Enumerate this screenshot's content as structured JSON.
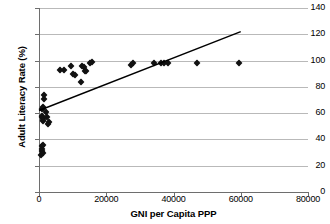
{
  "chart_data": {
    "type": "scatter",
    "title": "",
    "xlabel": "GNI per Capita PPP",
    "ylabel": "Adult Literacy Rate (%)",
    "xlim": [
      0,
      80000
    ],
    "ylim": [
      0,
      140
    ],
    "xticks": [
      0,
      20000,
      40000,
      60000,
      80000
    ],
    "yticks": [
      0,
      20,
      40,
      60,
      80,
      100,
      120,
      140
    ],
    "xtick_labels": [
      "0",
      "20000",
      "40000",
      "60000",
      "80000"
    ],
    "ytick_labels": [
      "0",
      "20",
      "40",
      "60",
      "80",
      "100",
      "120",
      "140"
    ],
    "grid": "horizontal",
    "legend": "none",
    "marker": "diamond",
    "marker_color": "#111111",
    "series": [
      {
        "name": "Countries",
        "points": [
          [
            700,
            28
          ],
          [
            800,
            31
          ],
          [
            900,
            33
          ],
          [
            1000,
            35
          ],
          [
            1100,
            36
          ],
          [
            1200,
            30
          ],
          [
            900,
            57
          ],
          [
            1000,
            58
          ],
          [
            1100,
            56
          ],
          [
            1200,
            55
          ],
          [
            1300,
            54
          ],
          [
            1000,
            63
          ],
          [
            1100,
            64
          ],
          [
            1200,
            65
          ],
          [
            1500,
            74
          ],
          [
            1600,
            71
          ],
          [
            2200,
            61
          ],
          [
            2600,
            52
          ],
          [
            3000,
            53
          ],
          [
            2400,
            57
          ],
          [
            6300,
            93
          ],
          [
            7300,
            93
          ],
          [
            9500,
            96
          ],
          [
            10200,
            90
          ],
          [
            10800,
            89
          ],
          [
            12600,
            84
          ],
          [
            12900,
            96
          ],
          [
            13400,
            95
          ],
          [
            13600,
            92
          ],
          [
            14000,
            92
          ],
          [
            15200,
            98
          ],
          [
            15700,
            99
          ],
          [
            27400,
            97
          ],
          [
            27900,
            98
          ],
          [
            34100,
            98
          ],
          [
            36400,
            98
          ],
          [
            37100,
            98
          ],
          [
            38400,
            98
          ],
          [
            47000,
            98
          ],
          [
            59500,
            98
          ]
        ]
      }
    ],
    "trendline": {
      "label": "linear fit",
      "color": "#000000",
      "x0": 0,
      "y0": 62,
      "x1": 60000,
      "y1": 122
    }
  }
}
